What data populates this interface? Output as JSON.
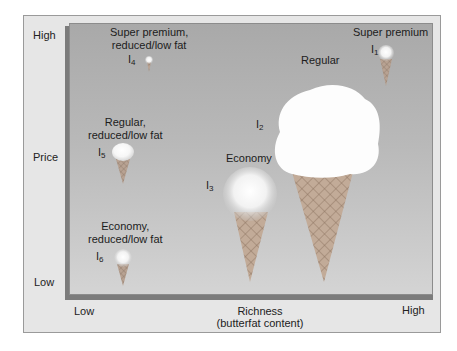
{
  "y_axis": {
    "title": "Price",
    "high": "High",
    "low": "Low"
  },
  "x_axis": {
    "title_line1": "Richness",
    "title_line2": "(butterfat content)",
    "low": "Low",
    "high": "High"
  },
  "items": [
    {
      "id": "I",
      "sub": "1",
      "name": "Super premium"
    },
    {
      "id": "I",
      "sub": "2",
      "name": "Regular"
    },
    {
      "id": "I",
      "sub": "3",
      "name": "Economy"
    },
    {
      "id": "I",
      "sub": "4",
      "name_line1": "Super premium,",
      "name_line2": "reduced/low fat"
    },
    {
      "id": "I",
      "sub": "5",
      "name_line1": "Regular,",
      "name_line2": "reduced/low fat"
    },
    {
      "id": "I",
      "sub": "6",
      "name_line1": "Economy,",
      "name_line2": "reduced/low fat"
    }
  ],
  "colors": {
    "plot_bg_top": "#a9a9a9",
    "plot_bg_bottom": "#d4d4d4",
    "frame_bg": "#e6e6e6",
    "cone": "#b49a86",
    "scoop": "#ffffff"
  }
}
